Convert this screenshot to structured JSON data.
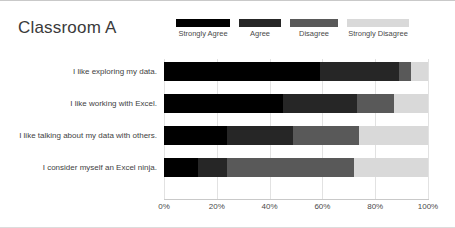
{
  "chart": {
    "title": "Classroom A",
    "x_axis": {
      "ticks": [
        "0%",
        "20%",
        "40%",
        "60%",
        "80%",
        "100%"
      ]
    }
  },
  "legend": {
    "items": [
      {
        "label": "Strongly Agree",
        "color": "#000000"
      },
      {
        "label": "Agree",
        "color": "#262626"
      },
      {
        "label": "Disagree",
        "color": "#595959"
      },
      {
        "label": "Strongly Disagree",
        "color": "#d9d9d9"
      }
    ]
  },
  "chart_data": {
    "type": "bar",
    "orientation": "horizontal",
    "stacked": true,
    "stack_mode": "percent",
    "title": "Classroom A",
    "xlabel": "",
    "ylabel": "",
    "xlim": [
      0,
      100
    ],
    "xticks": [
      0,
      20,
      40,
      60,
      80,
      100
    ],
    "xtick_labels": [
      "0%",
      "20%",
      "40%",
      "60%",
      "80%",
      "100%"
    ],
    "grid": true,
    "legend_position": "top",
    "categories": [
      "I like exploring my data.",
      "I like working with Excel.",
      "I like talking about my data with others.",
      "I consider myself an Excel ninja."
    ],
    "series": [
      {
        "name": "Strongly Agree",
        "color": "#000000",
        "values": [
          59,
          45,
          24,
          13
        ]
      },
      {
        "name": "Agree",
        "color": "#262626",
        "values": [
          30,
          28,
          25,
          11
        ]
      },
      {
        "name": "Disagree",
        "color": "#595959",
        "values": [
          4.5,
          14,
          25,
          48
        ]
      },
      {
        "name": "Strongly Disagree",
        "color": "#d9d9d9",
        "values": [
          6.5,
          13,
          26,
          28
        ]
      }
    ]
  }
}
